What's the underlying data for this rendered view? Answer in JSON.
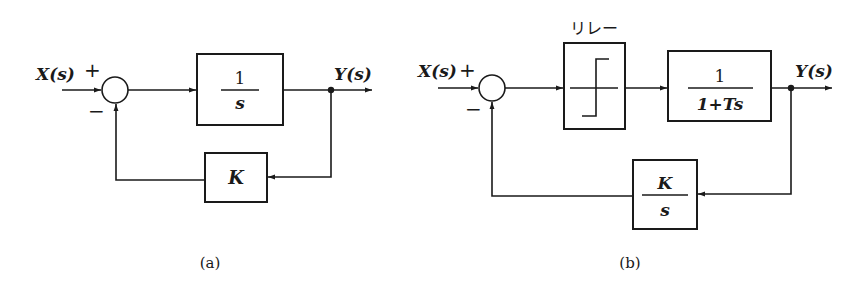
{
  "diagrams": {
    "a": {
      "caption": "(a)",
      "input_label": "X(s)",
      "output_label": "Y(s)",
      "sum_plus": "+",
      "sum_minus": "−",
      "forward_block": {
        "numerator": "1",
        "denominator": "s"
      },
      "feedback_block": {
        "label": "K"
      }
    },
    "b": {
      "caption": "(b)",
      "input_label": "X(s)",
      "output_label": "Y(s)",
      "sum_plus": "+",
      "sum_minus": "−",
      "relay_block": {
        "label": "リレー"
      },
      "forward_block": {
        "numerator": "1",
        "denominator": "1+Ts"
      },
      "feedback_block": {
        "numerator": "K",
        "denominator": "s"
      }
    }
  }
}
